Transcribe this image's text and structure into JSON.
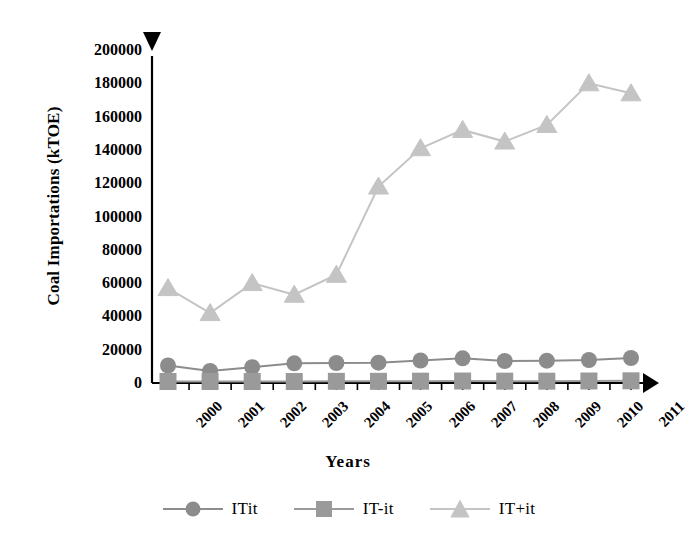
{
  "chart_data": {
    "type": "line",
    "title": "",
    "xlabel": "Years",
    "ylabel": "Coal Importations (kTOE)",
    "categories": [
      "2000",
      "2001",
      "2002",
      "2003",
      "2004",
      "2005",
      "2006",
      "2007",
      "2008",
      "2009",
      "2010",
      "2011"
    ],
    "ylim": [
      0,
      200000
    ],
    "yticks": [
      0,
      20000,
      40000,
      60000,
      80000,
      100000,
      120000,
      140000,
      160000,
      180000,
      200000
    ],
    "ytick_labels": [
      "0",
      "20000",
      "40000",
      "60000",
      "80000",
      "100000",
      "120000",
      "140000",
      "160000",
      "180000",
      "200000"
    ],
    "grid": false,
    "legend_position": "bottom",
    "series": [
      {
        "name": "ITit",
        "marker": "circle",
        "color": "#8c8c8c",
        "values": [
          10500,
          7200,
          9500,
          11800,
          12000,
          12200,
          13500,
          14800,
          13200,
          13400,
          13800,
          15000
        ]
      },
      {
        "name": "IT-it",
        "marker": "square",
        "color": "#9a9a9a",
        "values": [
          900,
          900,
          900,
          900,
          1000,
          1000,
          1100,
          1200,
          1100,
          1100,
          1200,
          1300
        ]
      },
      {
        "name": "IT+it",
        "marker": "triangle",
        "color": "#c4c4c4",
        "values": [
          57000,
          42000,
          60000,
          53000,
          65000,
          118000,
          141000,
          152000,
          145000,
          155000,
          180000,
          174000
        ]
      }
    ]
  },
  "axes": {
    "y_arrow_icon": "triangle-down-arrowhead",
    "x_arrow_icon": "triangle-right-arrowhead",
    "axis_color": "#000000"
  },
  "legend": {
    "items": [
      {
        "label": "ITit",
        "marker": "circle-marker",
        "color": "#8c8c8c"
      },
      {
        "label": "IT-it",
        "marker": "square-marker",
        "color": "#9a9a9a"
      },
      {
        "label": "IT+it",
        "marker": "triangle-marker",
        "color": "#c4c4c4"
      }
    ]
  }
}
